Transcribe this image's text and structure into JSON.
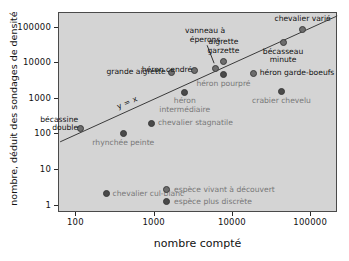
{
  "chart_data": {
    "type": "scatter",
    "title": "",
    "xlabel": "nombre compté",
    "ylabel": "nombre, déduit des sondages de densité",
    "xscale": "log",
    "yscale": "log",
    "xlim": [
      60,
      220000
    ],
    "ylim": [
      0.62,
      260000
    ],
    "xticks": [
      100,
      1000,
      10000,
      100000
    ],
    "xtick_labels": [
      "100",
      "1000",
      "10000",
      "100000"
    ],
    "yticks": [
      1,
      10,
      100,
      1000,
      10000,
      100000
    ],
    "ytick_labels": [
      "1",
      "10",
      "100",
      "1000",
      "10000",
      "100000"
    ],
    "grid": false,
    "plot_bg": "#d4d4d4",
    "reference_line": {
      "label": "y = x",
      "equation": "y = x",
      "x_start": 62,
      "x_end": 215000
    },
    "legend": {
      "position": "bottom-right-inside",
      "entries": [
        {
          "key": "open",
          "label": "espèce vivant à découvert",
          "marker": "ring",
          "color": "#6d6d6d"
        },
        {
          "key": "discrete",
          "label": "espèce plus discrète",
          "marker": "filled",
          "color": "#4a4a4a"
        }
      ]
    },
    "points": [
      {
        "label": "bécassine\ndouble",
        "x": 115,
        "y": 140,
        "group": "open",
        "label_pos": "above-left"
      },
      {
        "label": "rhynchée peinte",
        "x": 410,
        "y": 98,
        "group": "discrete",
        "label_pos": "below"
      },
      {
        "label": "chevalier stagnatile",
        "x": 950,
        "y": 195,
        "group": "discrete",
        "label_pos": "right"
      },
      {
        "label": "chevalier cul-blanc",
        "x": 250,
        "y": 2,
        "group": "discrete",
        "label_pos": "right"
      },
      {
        "label": "grande aigrette",
        "x": 1700,
        "y": 5200,
        "group": "open",
        "label_pos": "left"
      },
      {
        "label": "héron\nintermédiaire",
        "x": 2500,
        "y": 1450,
        "group": "discrete",
        "label_pos": "below"
      },
      {
        "label": "héron cendré",
        "x": 3300,
        "y": 6000,
        "group": "open",
        "label_pos": "above-left"
      },
      {
        "label": "vanneau à\néperons",
        "x": 6100,
        "y": 6800,
        "group": "open",
        "label_pos": "leader-above"
      },
      {
        "label": "aigrette\ngarzette",
        "x": 7800,
        "y": 10500,
        "group": "open",
        "label_pos": "above"
      },
      {
        "label": "héron pourpré",
        "x": 7800,
        "y": 4500,
        "group": "discrete",
        "label_pos": "below"
      },
      {
        "label": "héron garde-boeufs",
        "x": 19000,
        "y": 5000,
        "group": "open",
        "label_pos": "right"
      },
      {
        "label": "crabier chevelu",
        "x": 43000,
        "y": 1500,
        "group": "discrete",
        "label_pos": "below"
      },
      {
        "label": "bécasseau\nminute",
        "x": 45000,
        "y": 36000,
        "group": "open",
        "label_pos": "below"
      },
      {
        "label": "chevalier varié",
        "x": 80000,
        "y": 85000,
        "group": "open",
        "label_pos": "above"
      }
    ]
  }
}
